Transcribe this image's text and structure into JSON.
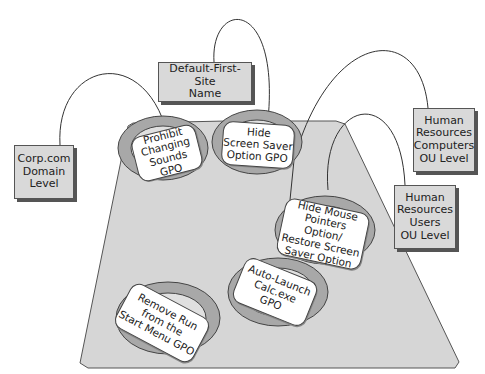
{
  "containers": [
    {
      "id": "domain",
      "label": "Corp.com\nDomain\nLevel"
    },
    {
      "id": "site",
      "label": "Default-First-Site\nName"
    },
    {
      "id": "hr_computers",
      "label": "Human\nResources\nComputers\nOU Level"
    },
    {
      "id": "hr_users",
      "label": "Human\nResources\nUsers\nOU Level"
    }
  ],
  "gpos": [
    {
      "id": "prohibit_sounds",
      "label": "Prohibit\nChanging\nSounds GPO",
      "linked_to": "domain"
    },
    {
      "id": "hide_screensaver",
      "label": "Hide\nScreen Saver\nOption GPO",
      "linked_to": "site"
    },
    {
      "id": "hide_mouse",
      "label": "Hide Mouse\nPointers Option/\nRestore Screen\nSaver Option",
      "linked_to": "hr_users"
    },
    {
      "id": "auto_calc",
      "label": "Auto-Launch\nCalc.exe\nGPO",
      "linked_to": "hr_computers"
    },
    {
      "id": "remove_run",
      "label": "Remove Run\nfrom the\nStart Menu GPO",
      "linked_to": null
    }
  ],
  "colors": {
    "platform": "#d6d6d6",
    "box": "#d9d9d9",
    "ring": "#9a9a9a",
    "card": "#ffffff",
    "line": "#333333"
  }
}
